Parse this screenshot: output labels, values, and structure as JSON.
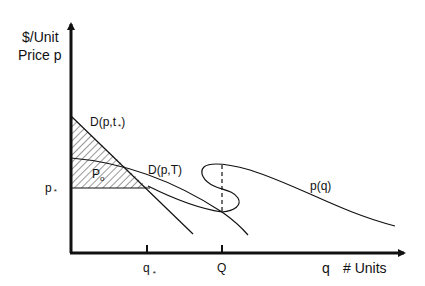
{
  "diagram": {
    "y_axis_label_line1": "$/Unit",
    "y_axis_label_line2": "Price p",
    "x_axis_var": "q",
    "x_axis_label": "# Units",
    "curves": {
      "demand_t_star": {
        "label": "D(p,t",
        "subscript": "*",
        "close": ")"
      },
      "demand_T": {
        "label": "D(p,T)"
      },
      "price_q": {
        "label": "p(q)"
      }
    },
    "region_label": {
      "main": "P",
      "subscript": "o"
    },
    "y_ticks": [
      {
        "label": "p",
        "subscript": "*"
      }
    ],
    "x_ticks": [
      {
        "label": "q",
        "subscript": "*"
      },
      {
        "label": "Q",
        "subscript": ""
      }
    ],
    "colors": {
      "ink": "#111111",
      "background": "#ffffff"
    }
  }
}
